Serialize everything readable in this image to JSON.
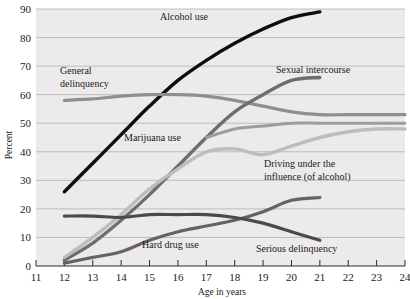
{
  "chart_data": {
    "type": "line",
    "title": "",
    "xlabel": "Age in years",
    "ylabel": "Percent",
    "xlim": [
      11,
      24
    ],
    "ylim": [
      0,
      90
    ],
    "xticks": [
      11,
      12,
      13,
      14,
      15,
      16,
      17,
      18,
      19,
      20,
      21,
      22,
      23,
      24
    ],
    "yticks": [
      0,
      10,
      20,
      30,
      40,
      50,
      60,
      70,
      80,
      90
    ],
    "grid": true,
    "legend": "inline-annotations",
    "series": [
      {
        "name": "Alcohol use",
        "color": "#0d0d0d",
        "label_x": 16.4,
        "label_y": 86,
        "x": [
          12,
          13,
          14,
          15,
          16,
          17,
          18,
          19,
          20,
          21
        ],
        "values": [
          26,
          36,
          46,
          56,
          65,
          72,
          78,
          83,
          87,
          89
        ]
      },
      {
        "name": "General delinquency",
        "color": "#8f8f8f",
        "label_x": 13.0,
        "label_y": 70,
        "x": [
          12,
          13,
          14,
          15,
          16,
          17,
          18,
          19,
          20,
          21,
          22,
          23,
          24
        ],
        "values": [
          58,
          58.5,
          59.5,
          60,
          60,
          59.5,
          58,
          56,
          54,
          53,
          53,
          53,
          53
        ]
      },
      {
        "name": "Sexual intercourse",
        "color": "#6e6e6e",
        "label_x": 19.1,
        "label_y": 70,
        "x": [
          12,
          13,
          14,
          15,
          16,
          17,
          18,
          19,
          20,
          21
        ],
        "values": [
          2,
          8,
          16,
          25,
          35,
          45,
          54,
          60,
          65,
          66
        ]
      },
      {
        "name": "Marijuana use",
        "color": "#bdbdbd",
        "label_x": 14.3,
        "label_y": 46,
        "x": [
          12,
          13,
          14,
          15,
          16,
          17,
          18,
          19,
          20,
          21,
          22,
          23,
          24
        ],
        "values": [
          3,
          10,
          18,
          27,
          34,
          40,
          41,
          39,
          42,
          45,
          47,
          48,
          48
        ]
      },
      {
        "name": "Driving under the influence (of alcohol)",
        "color": "#9d9d9d",
        "label_x": 19.3,
        "label_y": 38,
        "x": [
          17,
          18,
          19,
          20,
          21,
          22,
          23,
          24
        ],
        "values": [
          45,
          48,
          49,
          50,
          50,
          50,
          50,
          50
        ]
      },
      {
        "name": "Hard drug use",
        "color": "#636363",
        "label_x": 16.6,
        "label_y": 10,
        "x": [
          12,
          13,
          14,
          15,
          16,
          17,
          18,
          19,
          20,
          21
        ],
        "values": [
          1,
          3,
          5,
          9,
          12,
          14,
          16,
          19,
          23,
          24
        ]
      },
      {
        "name": "Serious delinquency",
        "color": "#4a4a4a",
        "label_x": 20.6,
        "label_y": 8,
        "x": [
          12,
          13,
          14,
          15,
          16,
          17,
          18,
          19,
          20,
          21
        ],
        "values": [
          17.5,
          17.5,
          17,
          18,
          18,
          18,
          17,
          15,
          12,
          9
        ]
      }
    ]
  },
  "axes": {
    "y_label": "Percent",
    "x_label": "Age in years",
    "y_tick_labels": [
      "0",
      "10",
      "20",
      "30",
      "40",
      "50",
      "60",
      "70",
      "80",
      "90"
    ],
    "x_tick_labels": [
      "11",
      "12",
      "13",
      "14",
      "15",
      "16",
      "17",
      "18",
      "19",
      "20",
      "21",
      "22",
      "23",
      "24"
    ]
  },
  "annotations": {
    "alcohol_use": "Alcohol use",
    "general_delinquency_line1": "General",
    "general_delinquency_line2": "delinquency",
    "sexual_intercourse": "Sexual intercourse",
    "marijuana_use": "Marijuana use",
    "dui_line1": "Driving under the",
    "dui_line2": "influence (of alcohol)",
    "hard_drug_use": "Hard drug use",
    "serious_delinquency": "Serious delinquency"
  },
  "colors": {
    "plot_background": "#eceaea",
    "page_background": "#ffffff",
    "gridline": "#a9a9a9",
    "axis": "#2a2a2a"
  }
}
